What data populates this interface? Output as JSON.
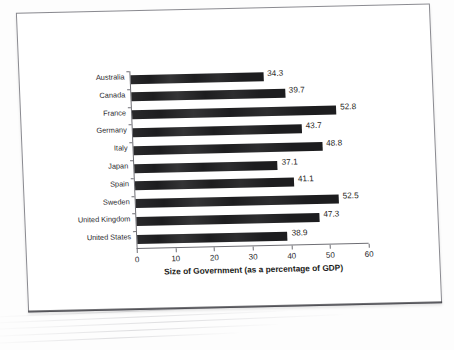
{
  "document": {
    "kind": "scanned-page",
    "page_border_color": "#8a8a90",
    "background_color": "#ffffff"
  },
  "chart_data": {
    "type": "bar",
    "orientation": "horizontal",
    "title": "",
    "xlabel": "Size of Government (as a percentage of GDP)",
    "ylabel": "",
    "xlim": [
      0,
      60
    ],
    "xticks": [
      0,
      10,
      20,
      30,
      40,
      50,
      60
    ],
    "grid": false,
    "legend": false,
    "bar_color": "#1d1d1f",
    "categories": [
      "Australia",
      "Canada",
      "France",
      "Germany",
      "Italy",
      "Japan",
      "Spain",
      "Sweden",
      "United Kingdom",
      "United States"
    ],
    "values": [
      34.3,
      39.7,
      52.8,
      43.7,
      48.8,
      37.1,
      41.1,
      52.5,
      47.3,
      38.9
    ],
    "value_labels": [
      "34.3",
      "39.7",
      "52.8",
      "43.7",
      "48.8",
      "37.1",
      "41.1",
      "52.5",
      "47.3",
      "38.9"
    ],
    "xtick_labels": [
      "0",
      "10",
      "20",
      "30",
      "40",
      "50",
      "60"
    ]
  }
}
